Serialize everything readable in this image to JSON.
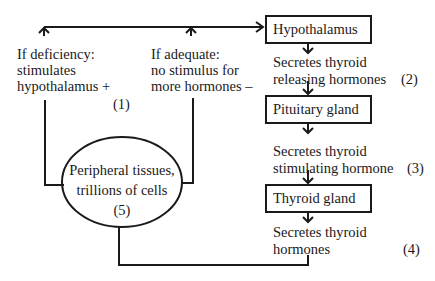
{
  "diagram": {
    "nodes": {
      "hypothalamus": "Hypothalamus",
      "pituitary": "Pituitary gland",
      "thyroid": "Thyroid gland",
      "peripheral_line1": "Peripheral tissues,",
      "peripheral_line2": "trillions of cells",
      "peripheral_step": "(5)"
    },
    "steps": {
      "step1_number": "(1)",
      "step2_line1": "Secretes thyroid",
      "step2_line2": "releasing hormones",
      "step2_number": "(2)",
      "step3_line1": "Secretes thyroid",
      "step3_line2": "stimulating  hormone",
      "step3_number": "(3)",
      "step4_line1": "Secretes thyroid",
      "step4_line2": "hormones",
      "step4_number": "(4)"
    },
    "feedback": {
      "deficiency_line1": "If deficiency:",
      "deficiency_line2": "stimulates",
      "deficiency_line3": "hypothalamus +",
      "adequate_line1": "If adequate:",
      "adequate_line2": "no stimulus for",
      "adequate_line3": "more hormones  –"
    }
  }
}
